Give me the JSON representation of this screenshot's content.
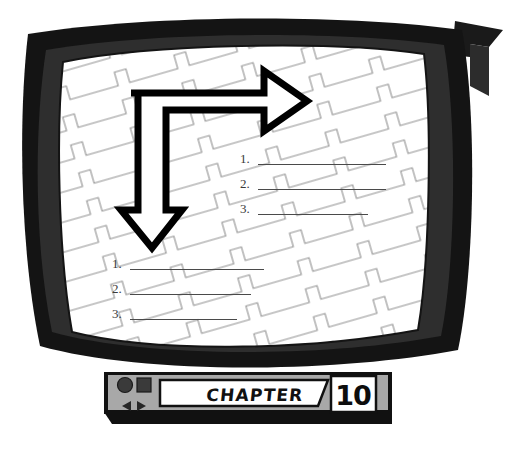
{
  "scene": {
    "title": "Television set illustration with chapter label",
    "style": "black-and-white line art"
  },
  "tv": {
    "bezel_color": "#1a1a1a",
    "bezel_highlight_color": "#3d3d3d",
    "screen_color": "#ffffff",
    "screen_pattern": "sawtooth-diagonal-lines",
    "screen_pattern_color": "#8c8c8c"
  },
  "screen": {
    "arrow": {
      "name": "bent-arrow",
      "description": "L-shaped double-headed arrow pointing right and down",
      "fill": "#ffffff",
      "stroke": "#000000"
    },
    "list_right": {
      "items": [
        {
          "marker": "1.",
          "rule_width": 128
        },
        {
          "marker": "2.",
          "rule_width": 128
        },
        {
          "marker": "3.",
          "rule_width": 110
        }
      ]
    },
    "list_left": {
      "items": [
        {
          "marker": "1.",
          "rule_width": 134
        },
        {
          "marker": "2.",
          "rule_width": 121
        },
        {
          "marker": "3.",
          "rule_width": 107
        }
      ]
    }
  },
  "control_bar": {
    "background_color": "#a8a8a8",
    "shadow_color": "#111111",
    "icons": [
      {
        "name": "circle-button",
        "shape": "circle",
        "color": "#3a3a3a"
      },
      {
        "name": "square-button",
        "shape": "square",
        "color": "#3a3a3a"
      },
      {
        "name": "previous-button",
        "shape": "triangle-left",
        "color": "#2b2b2b"
      },
      {
        "name": "next-button",
        "shape": "triangle-right",
        "color": "#2b2b2b"
      }
    ],
    "chapter_label": "CHAPTER",
    "chapter_number": "10",
    "plate_color": "#ffffff",
    "plate_border_color": "#111111"
  }
}
